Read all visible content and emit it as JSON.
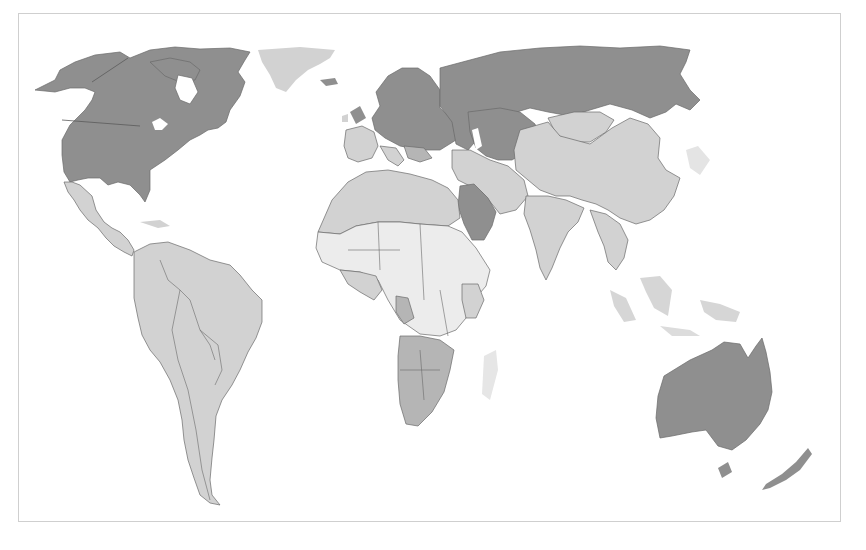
{
  "map": {
    "type": "choropleth",
    "projection": "world (Pacific-cropped, Americas to Oceania)",
    "frame": {
      "x": 18,
      "y": 13,
      "width": 823,
      "height": 509,
      "border_color": "#cfcfcf"
    },
    "shade_scale": {
      "darkest": "#8f8f8f",
      "medium": "#b5b5b5",
      "light": "#d2d2d2",
      "lightest": "#ececec"
    },
    "regions": [
      {
        "name": "Canada",
        "shade": "darkest"
      },
      {
        "name": "United States",
        "shade": "darkest"
      },
      {
        "name": "Alaska",
        "shade": "darkest"
      },
      {
        "name": "Greenland",
        "shade": "light"
      },
      {
        "name": "Iceland",
        "shade": "darkest"
      },
      {
        "name": "Mexico",
        "shade": "light"
      },
      {
        "name": "Central America",
        "shade": "light"
      },
      {
        "name": "South America",
        "shade": "light"
      },
      {
        "name": "Northern/Central Europe",
        "shade": "darkest"
      },
      {
        "name": "Southern/Western Europe",
        "shade": "light"
      },
      {
        "name": "Russia",
        "shade": "darkest"
      },
      {
        "name": "Central Asia",
        "shade": "darkest"
      },
      {
        "name": "Saudi Arabia",
        "shade": "darkest"
      },
      {
        "name": "Middle East",
        "shade": "light"
      },
      {
        "name": "North Africa",
        "shade": "light"
      },
      {
        "name": "Sahel / Central Africa",
        "shade": "lightest"
      },
      {
        "name": "West Africa coast",
        "shade": "medium"
      },
      {
        "name": "East Africa",
        "shade": "light"
      },
      {
        "name": "Southern Africa",
        "shade": "medium"
      },
      {
        "name": "Madagascar",
        "shade": "lightest"
      },
      {
        "name": "Mongolia",
        "shade": "light"
      },
      {
        "name": "China",
        "shade": "light"
      },
      {
        "name": "India",
        "shade": "light"
      },
      {
        "name": "Southeast Asia",
        "shade": "light"
      },
      {
        "name": "Japan",
        "shade": "lightest"
      },
      {
        "name": "Indonesia",
        "shade": "light"
      },
      {
        "name": "Australia",
        "shade": "darkest"
      },
      {
        "name": "New Zealand",
        "shade": "darkest"
      }
    ]
  }
}
